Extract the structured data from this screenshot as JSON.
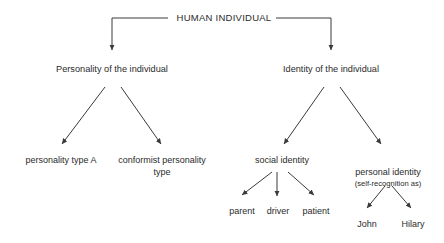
{
  "diagram": {
    "title": "HUMAN INDIVIDUAL",
    "background_color": "#ffffff",
    "stroke_color": "#3a3a3a",
    "text_color": "#2b2b2b",
    "nodes": {
      "root": "HUMAN INDIVIDUAL",
      "personality": "Personality of the individual",
      "identity": "Identity of the individual",
      "personality_type_a": "personality type A",
      "conformist_personality_type": "conformist personality type",
      "social_identity": "social identity",
      "personal_identity": "personal identity",
      "personal_identity_sub": "(self-recognition as)",
      "parent": "parent",
      "driver": "driver",
      "patient": "patient",
      "john": "John",
      "hilary": "Hilary"
    }
  }
}
